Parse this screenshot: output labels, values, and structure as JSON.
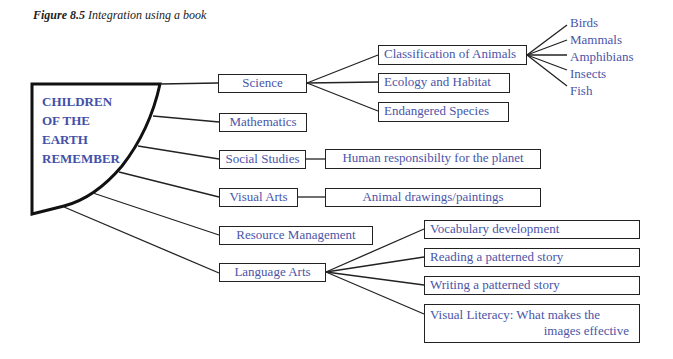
{
  "caption": {
    "number": "Figure 8.5",
    "text": "Integration using a book"
  },
  "center": {
    "lines": [
      "CHILDREN",
      "OF THE",
      "EARTH",
      "REMEMBER"
    ]
  },
  "subjects": [
    {
      "label": "Science"
    },
    {
      "label": "Mathematics"
    },
    {
      "label": "Social Studies"
    },
    {
      "label": "Visual Arts"
    },
    {
      "label": "Resource Management"
    },
    {
      "label": "Language Arts"
    }
  ],
  "science_topics": [
    {
      "label": "Classification of Animals"
    },
    {
      "label": "Ecology and Habitat"
    },
    {
      "label": "Endangered Species"
    }
  ],
  "animal_classes": [
    "Birds",
    "Mammals",
    "Amphibians",
    "Insects",
    "Fish"
  ],
  "social_studies_topics": [
    {
      "label": "Human responsibilty for the planet"
    }
  ],
  "visual_arts_topics": [
    {
      "label": "Animal drawings/paintings"
    }
  ],
  "language_arts_topics": [
    {
      "label": "Vocabulary development"
    },
    {
      "label": "Reading a patterned story"
    },
    {
      "label": "Writing a patterned story"
    },
    {
      "label_line1": "Visual Literacy: What makes the",
      "label_line2": "images effective"
    }
  ],
  "colors": {
    "text_blue": "#4a55a8",
    "line": "#222222"
  }
}
